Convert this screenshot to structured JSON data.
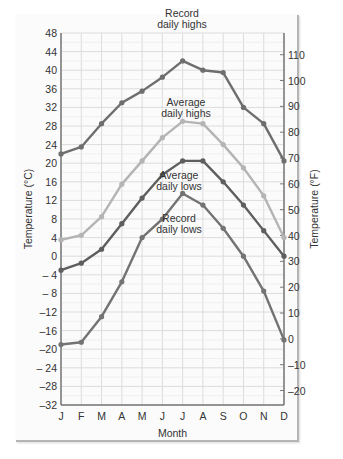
{
  "chart_data": {
    "type": "line",
    "title": "",
    "xlabel": "Month",
    "ylabel": "Temperature (°C)",
    "ylabel_right": "Temperature (°F)",
    "categories": [
      "J",
      "F",
      "M",
      "A",
      "M",
      "J",
      "J",
      "A",
      "S",
      "O",
      "N",
      "D"
    ],
    "ylim": [
      -32,
      48
    ],
    "yticks": [
      48,
      44,
      40,
      36,
      32,
      28,
      24,
      20,
      16,
      12,
      8,
      4,
      0,
      -4,
      -8,
      -12,
      -16,
      -20,
      -24,
      -28,
      -32
    ],
    "ytick_labels": [
      "48",
      "44",
      "40",
      "36",
      "32",
      "28",
      "24",
      "20",
      "16",
      "12",
      "8",
      "4",
      "0",
      "– 4",
      "– 8",
      "–12",
      "–16",
      "–20",
      "– 24",
      "–28",
      "–32"
    ],
    "yticks_right_f": [
      110,
      100,
      90,
      80,
      70,
      60,
      50,
      40,
      30,
      20,
      10,
      0,
      -10,
      -20
    ],
    "ytick_labels_right": [
      "110",
      "100",
      "90",
      "80",
      "70",
      "60",
      "50",
      "40",
      "30",
      "20",
      "10",
      "0",
      "–10",
      "–20"
    ],
    "grid": true,
    "series": [
      {
        "name": "Record daily highs",
        "label_lines": [
          "Record",
          "daily highs"
        ],
        "color": "#6e6e6e",
        "values": [
          22,
          23.5,
          28.5,
          33,
          35.5,
          38.5,
          42,
          40,
          39.5,
          32,
          28.5,
          20.5
        ]
      },
      {
        "name": "Average daily highs",
        "label_lines": [
          "Average",
          "daily highs"
        ],
        "color": "#b4b4b4",
        "values": [
          3.5,
          4.5,
          8.5,
          15.5,
          20.5,
          25.5,
          29,
          28.5,
          24,
          19,
          13,
          4
        ]
      },
      {
        "name": "Average daily lows",
        "label_lines": [
          "Average",
          "daily lows"
        ],
        "color": "#5e5e5e",
        "values": [
          -3,
          -1.5,
          1.5,
          7,
          12.5,
          17.5,
          20.5,
          20.5,
          16,
          11,
          5.5,
          0
        ]
      },
      {
        "name": "Record daily lows",
        "label_lines": [
          "Record",
          "daily lows"
        ],
        "color": "#737373",
        "values": [
          -19,
          -18.5,
          -13,
          -5.5,
          4,
          8,
          13.5,
          11,
          6,
          0,
          -7.5,
          -18
        ]
      }
    ]
  }
}
